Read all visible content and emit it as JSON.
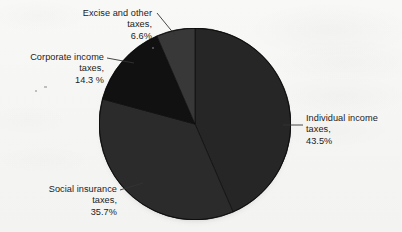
{
  "figure": {
    "kind": "pie-chart",
    "background_color": "#f6f6f5",
    "pie": {
      "center_x": 191,
      "center_y": 120,
      "radius": 92,
      "start_angle_deg": 0,
      "direction": "clockwise",
      "has_drop_shadow": true
    }
  },
  "labels": {
    "individual": {
      "line1": "Individual income",
      "line2": "taxes,",
      "line3": "43.5%"
    },
    "social": {
      "line1": "Social insurance",
      "line2": "taxes,",
      "line3": "35.7%"
    },
    "corporate": {
      "line1": "Corporate income",
      "line2": "taxes,",
      "line3": "14.3 %"
    },
    "excise": {
      "line1": "Excise and other",
      "line2": "taxes,",
      "line3": "6.6%"
    }
  },
  "chart_data": {
    "type": "pie",
    "title": "",
    "subtitle": "",
    "xlabel": "",
    "ylabel": "",
    "grid": false,
    "legend_position": "none",
    "label_style": "outside-with-leader-lines",
    "start_angle_deg": 0,
    "direction": "clockwise",
    "units": "percent",
    "total": 100.1,
    "categories": [
      "Individual income taxes",
      "Social insurance taxes",
      "Corporate income taxes",
      "Excise and other taxes"
    ],
    "values": [
      43.5,
      35.7,
      14.3,
      6.6
    ],
    "slices": [
      {
        "label": "Individual income taxes",
        "value": 43.5,
        "value_text": "43.5%",
        "color": "#262626",
        "start_angle_deg": 0.0,
        "end_angle_deg": 156.6,
        "label_anchor": "right",
        "label_lines": [
          "Individual income",
          "taxes,",
          "43.5%"
        ]
      },
      {
        "label": "Social insurance taxes",
        "value": 35.7,
        "value_text": "35.7%",
        "color": "#2b2b2b",
        "start_angle_deg": 156.6,
        "end_angle_deg": 285.1,
        "label_anchor": "bottom-left",
        "label_lines": [
          "Social insurance",
          "taxes,",
          "35.7%"
        ]
      },
      {
        "label": "Corporate income taxes",
        "value": 14.3,
        "value_text": "14.3 %",
        "color": "#111111",
        "start_angle_deg": 285.1,
        "end_angle_deg": 336.6,
        "label_anchor": "left",
        "label_lines": [
          "Corporate income",
          "taxes,",
          "14.3 %"
        ]
      },
      {
        "label": "Excise and other taxes",
        "value": 6.6,
        "value_text": "6.6%",
        "color": "#383838",
        "start_angle_deg": 336.6,
        "end_angle_deg": 360.0,
        "label_anchor": "top",
        "label_lines": [
          "Excise and other",
          "taxes,",
          "6.6%"
        ]
      }
    ]
  }
}
